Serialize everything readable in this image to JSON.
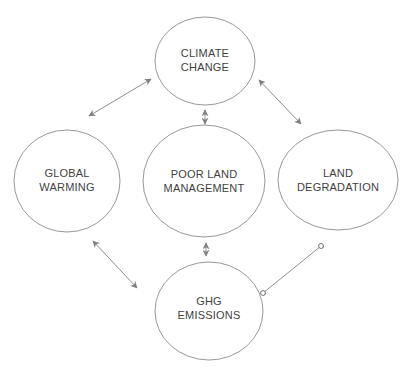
{
  "diagram": {
    "colors": {
      "background": "#ffffff",
      "node_fill": "#ffffff",
      "node_stroke": "#8c8c8c",
      "edge_stroke": "#808080",
      "text": "#3f3f3f"
    },
    "nodes": [
      {
        "id": "climate-change",
        "line1": "CLIMATE",
        "line2": "CHANGE"
      },
      {
        "id": "global-warming",
        "line1": "GLOBAL",
        "line2": "WARMING"
      },
      {
        "id": "poor-land-management",
        "line1": "POOR LAND",
        "line2": "MANAGEMENT"
      },
      {
        "id": "land-degradation",
        "line1": "LAND",
        "line2": "DEGRADATION"
      },
      {
        "id": "ghg-emissions",
        "line1": "GHG",
        "line2": "EMISSIONS"
      }
    ],
    "edges": [
      {
        "from": "global-warming",
        "to": "climate-change",
        "ends": "double-arrow"
      },
      {
        "from": "climate-change",
        "to": "land-degradation",
        "ends": "double-arrow"
      },
      {
        "from": "climate-change",
        "to": "poor-land-management",
        "ends": "double-arrow"
      },
      {
        "from": "poor-land-management",
        "to": "ghg-emissions",
        "ends": "double-arrow"
      },
      {
        "from": "global-warming",
        "to": "ghg-emissions",
        "ends": "double-arrow"
      },
      {
        "from": "ghg-emissions",
        "to": "land-degradation",
        "ends": "ring-ends"
      }
    ]
  }
}
